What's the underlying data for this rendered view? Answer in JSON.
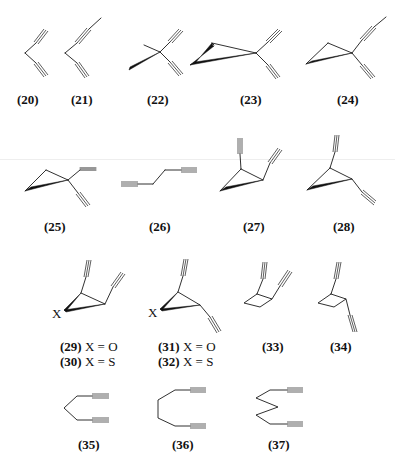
{
  "figure": {
    "compounds": [
      {
        "id": "20",
        "label": "(20)"
      },
      {
        "id": "21",
        "label": "(21)"
      },
      {
        "id": "22",
        "label": "(22)"
      },
      {
        "id": "23",
        "label": "(23)"
      },
      {
        "id": "24",
        "label": "(24)"
      },
      {
        "id": "25",
        "label": "(25)"
      },
      {
        "id": "26",
        "label": "(26)"
      },
      {
        "id": "27",
        "label": "(27)"
      },
      {
        "id": "28",
        "label": "(28)"
      },
      {
        "id": "29",
        "label": "(29)",
        "suffix": " X = O"
      },
      {
        "id": "30",
        "label": "(30)",
        "suffix": " X = S"
      },
      {
        "id": "31",
        "label": "(31)",
        "suffix": " X = O"
      },
      {
        "id": "32",
        "label": "(32)",
        "suffix": " X = S"
      },
      {
        "id": "33",
        "label": "(33)"
      },
      {
        "id": "34",
        "label": "(34)"
      },
      {
        "id": "35",
        "label": "(35)"
      },
      {
        "id": "36",
        "label": "(36)"
      },
      {
        "id": "37",
        "label": "(37)"
      }
    ],
    "heteroatom_label": "X"
  }
}
